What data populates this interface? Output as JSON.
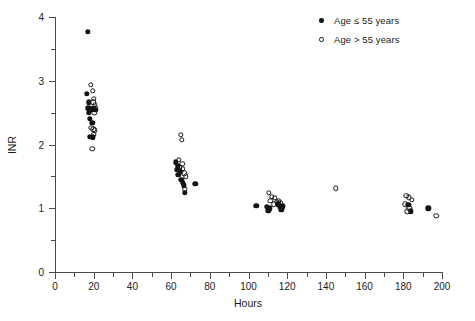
{
  "chart_data": {
    "type": "scatter",
    "title": "",
    "xlabel": "Hours",
    "ylabel": "INR",
    "xlim": [
      0,
      200
    ],
    "ylim": [
      0,
      4
    ],
    "xticks": [
      0,
      20,
      40,
      60,
      80,
      100,
      120,
      140,
      160,
      180,
      200
    ],
    "xminor": [
      10,
      30,
      50,
      70,
      90,
      110,
      130,
      150,
      170,
      190
    ],
    "yticks": [
      0,
      1,
      2,
      3,
      4
    ],
    "yminor": [
      0.5,
      1.5,
      2.5,
      3.5
    ],
    "grid": false,
    "legend_position": "top-right",
    "series": [
      {
        "name": "Age ≤ 55 years",
        "marker": "filled-circle",
        "color": "#141414",
        "points": [
          [
            17.0,
            3.77
          ],
          [
            16.5,
            2.8
          ],
          [
            17.5,
            2.66
          ],
          [
            17.2,
            2.57
          ],
          [
            18.2,
            2.56
          ],
          [
            19.0,
            2.55
          ],
          [
            20.0,
            2.56
          ],
          [
            20.8,
            2.54
          ],
          [
            17.4,
            2.5
          ],
          [
            18.0,
            2.4
          ],
          [
            19.3,
            2.34
          ],
          [
            17.9,
            2.12
          ],
          [
            19.6,
            2.11
          ],
          [
            62.5,
            1.72
          ],
          [
            63.5,
            1.66
          ],
          [
            62.8,
            1.6
          ],
          [
            64.5,
            1.58
          ],
          [
            63.8,
            1.52
          ],
          [
            65.3,
            1.45
          ],
          [
            66.0,
            1.4
          ],
          [
            66.6,
            1.36
          ],
          [
            72.5,
            1.38
          ],
          [
            67.2,
            1.24
          ],
          [
            104.0,
            1.04
          ],
          [
            109.5,
            1.02
          ],
          [
            111.0,
            1.0
          ],
          [
            110.2,
            0.96
          ],
          [
            115.5,
            1.06
          ],
          [
            116.3,
            1.02
          ],
          [
            117.0,
            0.98
          ],
          [
            117.8,
            1.03
          ],
          [
            182.5,
            1.05
          ],
          [
            184.0,
            0.95
          ],
          [
            193.0,
            1.0
          ]
        ]
      },
      {
        "name": "Age > 55 years",
        "marker": "open-circle",
        "color": "#141414",
        "points": [
          [
            18.5,
            2.94
          ],
          [
            19.6,
            2.84
          ],
          [
            20.2,
            2.72
          ],
          [
            19.8,
            2.66
          ],
          [
            20.6,
            2.62
          ],
          [
            21.0,
            2.58
          ],
          [
            19.4,
            2.56
          ],
          [
            20.4,
            2.5
          ],
          [
            18.8,
            2.26
          ],
          [
            19.8,
            2.24
          ],
          [
            20.6,
            2.22
          ],
          [
            20.2,
            2.16
          ],
          [
            19.2,
            1.93
          ],
          [
            65.0,
            2.15
          ],
          [
            65.4,
            2.07
          ],
          [
            64.0,
            1.76
          ],
          [
            65.8,
            1.7
          ],
          [
            64.6,
            1.64
          ],
          [
            66.2,
            1.62
          ],
          [
            65.0,
            1.57
          ],
          [
            66.8,
            1.55
          ],
          [
            67.6,
            1.5
          ],
          [
            67.0,
            1.3
          ],
          [
            110.5,
            1.24
          ],
          [
            112.0,
            1.18
          ],
          [
            113.5,
            1.16
          ],
          [
            111.2,
            1.12
          ],
          [
            114.5,
            1.1
          ],
          [
            115.8,
            1.12
          ],
          [
            113.0,
            1.06
          ],
          [
            116.5,
            1.08
          ],
          [
            145.0,
            1.31
          ],
          [
            181.5,
            1.2
          ],
          [
            183.0,
            1.17
          ],
          [
            184.5,
            1.13
          ],
          [
            181.0,
            1.06
          ],
          [
            183.2,
            1.0
          ],
          [
            182.0,
            0.95
          ],
          [
            197.0,
            0.88
          ]
        ]
      }
    ]
  },
  "legend": {
    "items": [
      {
        "label": "Age ≤ 55 years",
        "marker": "filled-circle"
      },
      {
        "label": "Age > 55 years",
        "marker": "open-circle"
      }
    ]
  },
  "colors": {
    "marker": "#141414",
    "axis": "#4a4a4a",
    "text": "#1a1a1a",
    "background": "#ffffff"
  }
}
